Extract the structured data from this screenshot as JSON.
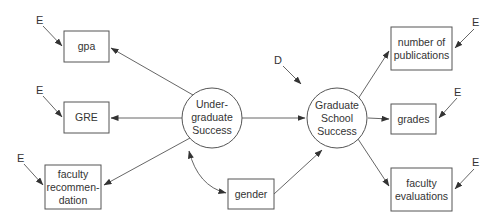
{
  "diagram": {
    "type": "structural-equation-model",
    "colors": {
      "stroke": "#555555",
      "text": "#333333",
      "background": "#ffffff"
    },
    "latent": [
      {
        "id": "ugs",
        "lines": [
          "Under-",
          "graduate",
          "Success"
        ]
      },
      {
        "id": "gss",
        "lines": [
          "Graduate",
          "School",
          "Success"
        ]
      }
    ],
    "observed": [
      {
        "id": "gpa",
        "lines": [
          "gpa"
        ]
      },
      {
        "id": "gre",
        "lines": [
          "GRE"
        ]
      },
      {
        "id": "facrec",
        "lines": [
          "faculty",
          "recommen-",
          "dation"
        ]
      },
      {
        "id": "gender",
        "lines": [
          "gender"
        ]
      },
      {
        "id": "pubs",
        "lines": [
          "number of",
          "publications"
        ]
      },
      {
        "id": "grades",
        "lines": [
          "grades"
        ]
      },
      {
        "id": "faceval",
        "lines": [
          "faculty",
          "evaluations"
        ]
      }
    ],
    "errors": [
      {
        "target": "gpa",
        "label": "E"
      },
      {
        "target": "gre",
        "label": "E"
      },
      {
        "target": "facrec",
        "label": "E"
      },
      {
        "target": "pubs",
        "label": "E"
      },
      {
        "target": "grades",
        "label": "E"
      },
      {
        "target": "faceval",
        "label": "E"
      }
    ],
    "disturbance": {
      "target": "gss",
      "label": "D"
    },
    "edges": [
      {
        "from": "ugs",
        "to": "gpa",
        "type": "directed"
      },
      {
        "from": "ugs",
        "to": "gre",
        "type": "directed"
      },
      {
        "from": "ugs",
        "to": "facrec",
        "type": "directed"
      },
      {
        "from": "ugs",
        "to": "gss",
        "type": "directed"
      },
      {
        "from": "ugs",
        "to": "gender",
        "type": "bidirectional"
      },
      {
        "from": "gender",
        "to": "gss",
        "type": "directed"
      },
      {
        "from": "gss",
        "to": "pubs",
        "type": "directed"
      },
      {
        "from": "gss",
        "to": "grades",
        "type": "directed"
      },
      {
        "from": "gss",
        "to": "faceval",
        "type": "directed"
      }
    ]
  }
}
